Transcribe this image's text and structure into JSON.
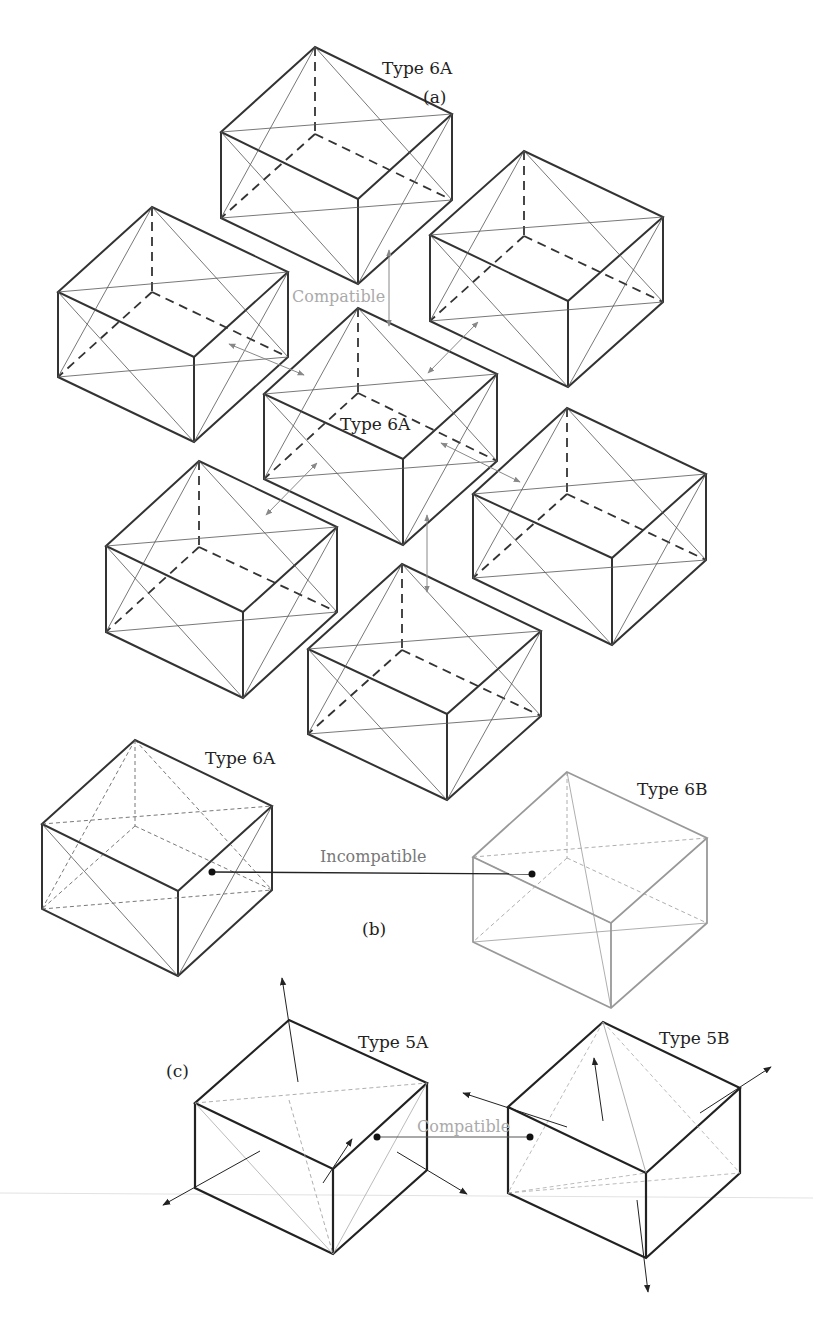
{
  "figure": {
    "panels": [
      {
        "id": "a",
        "label": "(a)"
      },
      {
        "id": "b",
        "label": "(b)"
      },
      {
        "id": "c",
        "label": "(c)"
      }
    ],
    "labels": {
      "panel_a": "(a)",
      "panel_b": "(b)",
      "panel_c": "(c)",
      "type6a_top": "Type 6A",
      "type6a_center": "Type 6A",
      "compatible_a": "Compatible",
      "type6a_b": "Type 6A",
      "type6b_b": "Type 6B",
      "incompatible_b": "Incompatible",
      "type5a_c": "Type 5A",
      "type5b_c": "Type 5B",
      "compatible_c": "Compatible"
    },
    "colors": {
      "edge": "#333333",
      "thin": "#555555",
      "light": "#999999",
      "arrow_gray": "#888888",
      "label_gray": "#aaaaaa"
    }
  }
}
